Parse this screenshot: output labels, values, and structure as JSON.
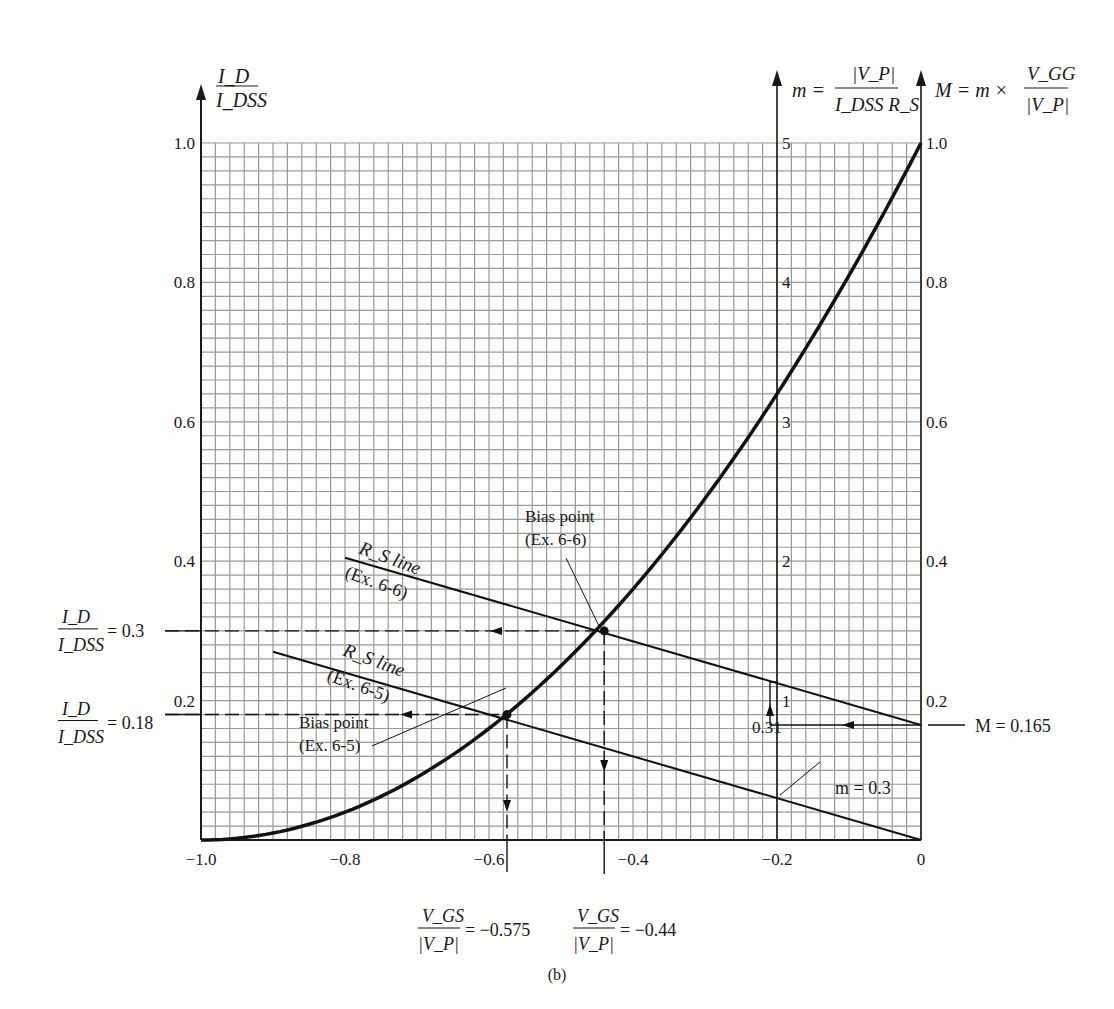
{
  "figure_label": "(b)",
  "chart_data": {
    "type": "line",
    "title": "",
    "x_axis": {
      "label": "V_GS / |V_P|",
      "range": [
        -1.0,
        0
      ],
      "ticks": [
        "-1.0",
        "-0.8",
        "-0.6",
        "-0.4",
        "-0.2",
        "0"
      ],
      "tick_values": [
        -1.0,
        -0.8,
        -0.6,
        -0.4,
        -0.2,
        0
      ]
    },
    "y_axis_left": {
      "label_num": "I_D",
      "label_den": "I_DSS",
      "range": [
        0,
        1.0
      ],
      "ticks": [
        "0.2",
        "0.4",
        "0.6",
        "0.8",
        "1.0"
      ],
      "tick_values": [
        0.2,
        0.4,
        0.6,
        0.8,
        1.0
      ]
    },
    "y_axis_m": {
      "label_lhs": "m =",
      "label_num": "|V_P|",
      "label_den": "I_DSS R_S",
      "position_x": -0.2,
      "range": [
        0,
        5
      ],
      "ticks": [
        "1",
        "2",
        "3",
        "4",
        "5"
      ],
      "tick_values": [
        1,
        2,
        3,
        4,
        5
      ]
    },
    "y_axis_right": {
      "label_lhs": "M = m ×",
      "label_num": "V_GG",
      "label_den": "|V_P|",
      "range": [
        0,
        1.0
      ],
      "ticks": [
        "0.2",
        "0.4",
        "0.6",
        "0.8",
        "1.0"
      ],
      "tick_values": [
        0.2,
        0.4,
        0.6,
        0.8,
        1.0
      ]
    },
    "grid": true,
    "grid_step": 0.02,
    "series": [
      {
        "name": "Transfer curve (I_D/I_DSS = (1 + V_GS/|V_P|)^2)",
        "x": [
          -1.0,
          -0.9,
          -0.8,
          -0.7,
          -0.6,
          -0.575,
          -0.5,
          -0.44,
          -0.4,
          -0.3,
          -0.2,
          -0.1,
          0
        ],
        "y": [
          0,
          0.01,
          0.04,
          0.09,
          0.16,
          0.18,
          0.25,
          0.3136,
          0.36,
          0.49,
          0.64,
          0.81,
          1.0
        ]
      },
      {
        "name": "R_S line (Ex. 6-6)",
        "x": [
          -0.8,
          0
        ],
        "y": [
          0.405,
          0.165
        ]
      },
      {
        "name": "R_S line (Ex. 6-5)",
        "x": [
          -0.9,
          0
        ],
        "y": [
          0.27,
          0
        ]
      }
    ],
    "annotations": {
      "rs_line_66": {
        "line1": "R_S line",
        "line2": "(Ex. 6-6)"
      },
      "rs_line_65": {
        "line1": "R_S line",
        "line2": "(Ex. 6-5)"
      },
      "bias_66": {
        "line1": "Bias point",
        "line2": "(Ex. 6-6)",
        "x": -0.44,
        "y": 0.3
      },
      "bias_65": {
        "line1": "Bias point",
        "line2": "(Ex. 6-5)",
        "x": -0.575,
        "y": 0.18
      },
      "id_03": {
        "num": "I_D",
        "den": "I_DSS",
        "value": "= 0.3"
      },
      "id_018": {
        "num": "I_D",
        "den": "I_DSS",
        "value": "= 0.18"
      },
      "vgs_0575": {
        "num": "V_GS",
        "den": "|V_P|",
        "value": "= −0.575"
      },
      "vgs_044": {
        "num": "V_GS",
        "den": "|V_P|",
        "value": "= −0.44"
      },
      "m_value": "m = 0.3",
      "m_031": "0.31",
      "M_value": "M = 0.165"
    }
  }
}
